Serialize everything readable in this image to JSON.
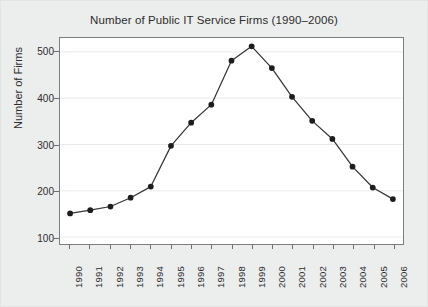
{
  "chart_data": {
    "type": "line",
    "title": "Number of Public IT Service Firms (1990–2006)",
    "xlabel": "",
    "ylabel": "Number of Firms",
    "categories": [
      "1990",
      "1991",
      "1992",
      "1993",
      "1994",
      "1995",
      "1996",
      "1997",
      "1998",
      "1999",
      "2000",
      "2001",
      "2002",
      "2003",
      "2004",
      "2005",
      "2006"
    ],
    "values": [
      151,
      158,
      166,
      185,
      209,
      297,
      347,
      386,
      481,
      512,
      465,
      403,
      351,
      312,
      252,
      207,
      182
    ],
    "series": [
      {
        "name": "Number of Firms",
        "values": [
          151,
          158,
          166,
          185,
          209,
          297,
          347,
          386,
          481,
          512,
          465,
          403,
          351,
          312,
          252,
          207,
          182
        ]
      }
    ],
    "x_tick_labels": [
      "1990",
      "1991",
      "1992",
      "1993",
      "1994",
      "1995",
      "1996",
      "1997",
      "1998",
      "1999",
      "2000",
      "2001",
      "2002",
      "2003",
      "2004",
      "2005",
      "2006"
    ],
    "y_tick_labels": [
      "100",
      "200",
      "300",
      "400",
      "500"
    ],
    "y_ticks": [
      100,
      200,
      300,
      400,
      500
    ],
    "ylim": [
      85,
      530
    ],
    "xlim": [
      1989.5,
      2006.5
    ],
    "grid": true,
    "grid_axis": "y",
    "legend": false,
    "legend_position": "none",
    "marker": "filled-circle",
    "line_color": "#35353a",
    "marker_color": "#1d1d20",
    "grid_color": "#e9eaec",
    "plot_background": "#ffffff",
    "figure_background": "#eceded",
    "axis_color": "#7d7d7d",
    "text_color": "#2c2c2c",
    "peak": {
      "category": "1999",
      "value": 512
    }
  }
}
